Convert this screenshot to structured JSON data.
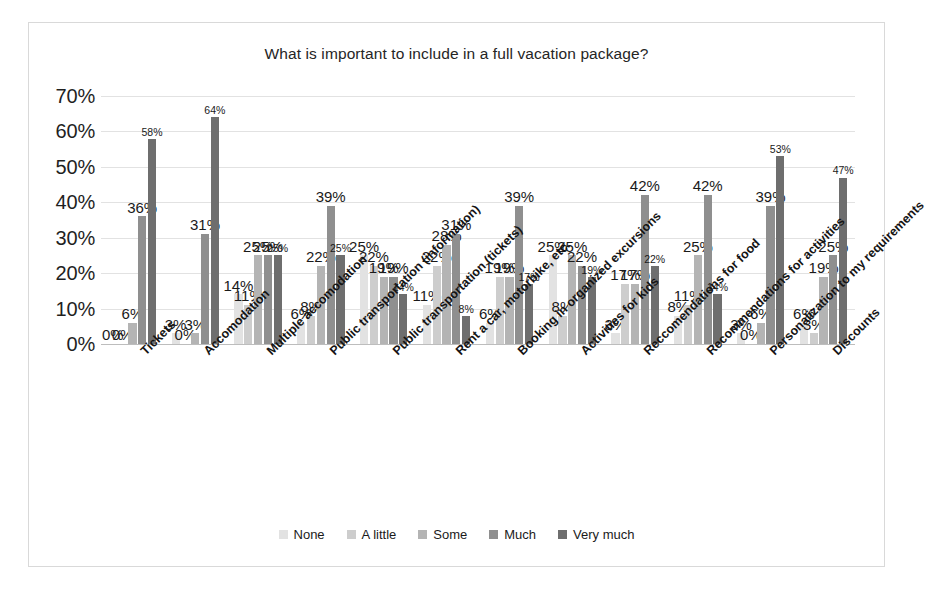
{
  "chart_data": {
    "type": "bar",
    "title": "What is important to include in a full vacation package?",
    "xlabel": "",
    "ylabel": "",
    "ylim": [
      0,
      70
    ],
    "ytick_labels": [
      "70%",
      "60%",
      "50%",
      "40%",
      "30%",
      "20%",
      "10%",
      "0%"
    ],
    "ytick_values": [
      70,
      60,
      50,
      40,
      30,
      20,
      10,
      0
    ],
    "grid": true,
    "legend_position": "bottom",
    "value_suffix": "%",
    "categories": [
      "Tickets",
      "Accomodation",
      "Multiple accomodation",
      "Public transportation (information)",
      "Public transportation (tickets)",
      "Rent a car, motorbike, etc.",
      "Booking in organized excursions",
      "Activities for kids",
      "Reccomendations for food",
      "Recommendations for activities",
      "Personalization to my requirements",
      "Discounts"
    ],
    "series": [
      {
        "name": "None",
        "color": "#e2e2e2",
        "values": [
          0,
          3,
          14,
          6,
          25,
          11,
          6,
          25,
          3,
          8,
          3,
          6
        ]
      },
      {
        "name": "A little",
        "color": "#cdcdcd",
        "values": [
          0,
          0,
          11,
          8,
          22,
          22,
          19,
          8,
          17,
          11,
          0,
          3
        ]
      },
      {
        "name": "Some",
        "color": "#b4b4b4",
        "values": [
          6,
          3,
          25,
          22,
          19,
          28,
          19,
          25,
          17,
          25,
          6,
          19
        ]
      },
      {
        "name": "Much",
        "color": "#8f8f8f",
        "values": [
          36,
          31,
          25,
          39,
          19,
          31,
          39,
          22,
          42,
          42,
          39,
          25
        ]
      },
      {
        "name": "Very much",
        "color": "#6e6e6e",
        "values": [
          58,
          64,
          25,
          25,
          14,
          8,
          17,
          19,
          22,
          14,
          53,
          47
        ]
      }
    ]
  }
}
